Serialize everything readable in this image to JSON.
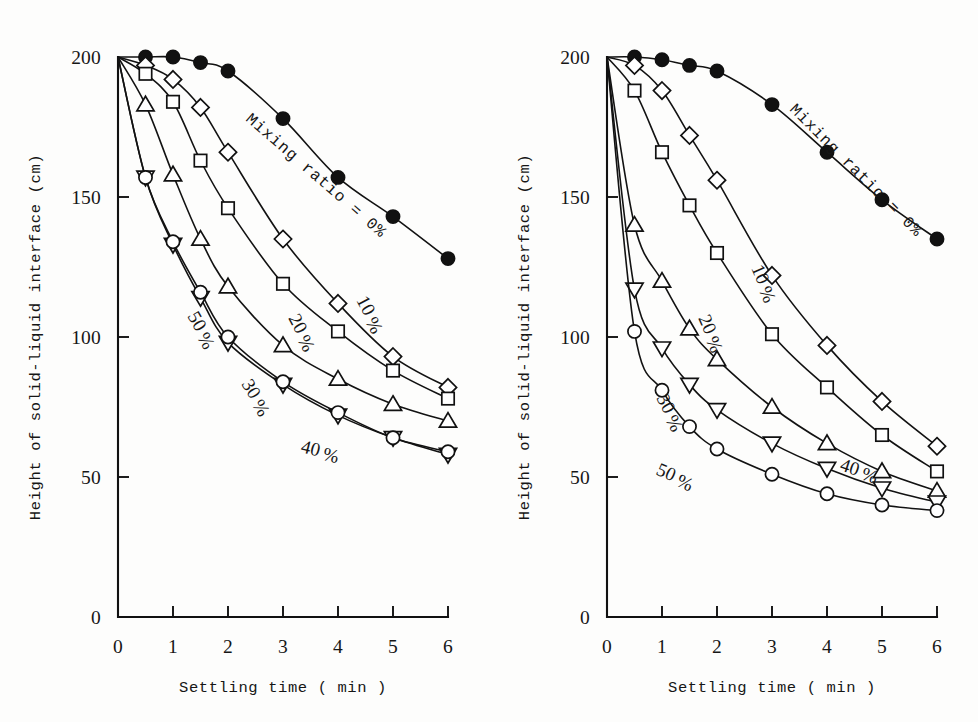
{
  "figure": {
    "background": "#fdfdfc",
    "ink": "#111111",
    "panel_count": 2
  },
  "axes": {
    "xlabel": "Settling time ( min )",
    "ylabel": "Height of solid-liquid interface (cm)",
    "xticks": [
      "0",
      "1",
      "2",
      "3",
      "4",
      "5",
      "6"
    ],
    "yticks": [
      "0",
      "50",
      "100",
      "150",
      "200"
    ],
    "xlim": [
      0,
      6
    ],
    "ylim": [
      0,
      200
    ]
  },
  "annotation": {
    "mixing_ratio": "Mixing ratio = 0%"
  },
  "series_labels": {
    "s0": "0",
    "s10": "10",
    "s20": "20",
    "s30": "30",
    "s40": "40",
    "s50": "50",
    "percent": "%"
  },
  "chart_data": [
    {
      "type": "line",
      "panel": "left",
      "title": "",
      "xlabel": "Settling time ( min )",
      "ylabel": "Height of solid-liquid interface (cm)",
      "xlim": [
        0,
        6
      ],
      "ylim": [
        0,
        200
      ],
      "xticks": [
        0,
        1,
        2,
        3,
        4,
        5,
        6
      ],
      "yticks": [
        0,
        50,
        100,
        150,
        200
      ],
      "grid": false,
      "legend": "inline-labels",
      "x": [
        0,
        0.5,
        1,
        1.5,
        2,
        3,
        4,
        5,
        6
      ],
      "series": [
        {
          "name": "Mixing ratio = 0%",
          "label": "0%",
          "marker": "filled-circle",
          "values": [
            200,
            200,
            200,
            198,
            195,
            178,
            157,
            143,
            128
          ]
        },
        {
          "name": "10%",
          "label": "10%",
          "marker": "diamond",
          "values": [
            200,
            197,
            192,
            182,
            166,
            135,
            112,
            93,
            82
          ]
        },
        {
          "name": "20%",
          "label": "20%",
          "marker": "square",
          "values": [
            200,
            194,
            184,
            163,
            146,
            119,
            102,
            88,
            78
          ]
        },
        {
          "name": "30%",
          "label": "30%",
          "marker": "triangle-up",
          "values": [
            200,
            183,
            158,
            135,
            118,
            97,
            85,
            76,
            70
          ]
        },
        {
          "name": "40%",
          "label": "40%",
          "marker": "triangle-down",
          "values": [
            200,
            157,
            133,
            114,
            98,
            83,
            72,
            64,
            58
          ]
        },
        {
          "name": "50%",
          "label": "50%",
          "marker": "circle",
          "values": [
            200,
            157,
            134,
            116,
            100,
            84,
            73,
            64,
            59
          ]
        }
      ]
    },
    {
      "type": "line",
      "panel": "right",
      "title": "",
      "xlabel": "Settling time ( min )",
      "ylabel": "Height of solid-liquid interface (cm)",
      "xlim": [
        0,
        6
      ],
      "ylim": [
        0,
        200
      ],
      "xticks": [
        0,
        1,
        2,
        3,
        4,
        5,
        6
      ],
      "yticks": [
        0,
        50,
        100,
        150,
        200
      ],
      "grid": false,
      "legend": "inline-labels",
      "x": [
        0,
        0.5,
        1,
        1.5,
        2,
        3,
        4,
        5,
        6
      ],
      "series": [
        {
          "name": "Mixing ratio = 0%",
          "label": "0%",
          "marker": "filled-circle",
          "values": [
            200,
            200,
            199,
            197,
            195,
            183,
            166,
            149,
            135
          ]
        },
        {
          "name": "10%",
          "label": "10%",
          "marker": "diamond",
          "values": [
            200,
            197,
            188,
            172,
            156,
            122,
            97,
            77,
            61
          ]
        },
        {
          "name": "20%",
          "label": "20%",
          "marker": "square",
          "values": [
            200,
            188,
            166,
            147,
            130,
            101,
            82,
            65,
            52
          ]
        },
        {
          "name": "30%",
          "label": "30%",
          "marker": "triangle-up",
          "values": [
            200,
            140,
            120,
            103,
            92,
            75,
            62,
            52,
            45
          ]
        },
        {
          "name": "40%",
          "label": "40%",
          "marker": "triangle-down",
          "values": [
            200,
            117,
            96,
            83,
            74,
            62,
            53,
            46,
            41
          ]
        },
        {
          "name": "50%",
          "label": "50%",
          "marker": "circle",
          "values": [
            200,
            102,
            81,
            68,
            60,
            51,
            44,
            40,
            38
          ]
        }
      ]
    }
  ]
}
